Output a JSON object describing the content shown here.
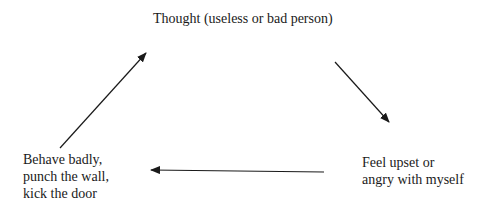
{
  "diagram": {
    "type": "cycle",
    "nodes": {
      "top": {
        "lines": [
          "Thought (useless or bad person)"
        ]
      },
      "right": {
        "lines": [
          "Feel upset or",
          "angry with myself"
        ]
      },
      "left": {
        "lines": [
          "Behave badly,",
          "punch the wall,",
          "kick the door"
        ]
      }
    },
    "edges": [
      {
        "from": "top",
        "to": "right"
      },
      {
        "from": "right",
        "to": "left"
      },
      {
        "from": "left",
        "to": "top"
      }
    ],
    "colors": {
      "text": "#1a1a1a",
      "arrow": "#1a1a1a",
      "background": "#ffffff"
    }
  }
}
